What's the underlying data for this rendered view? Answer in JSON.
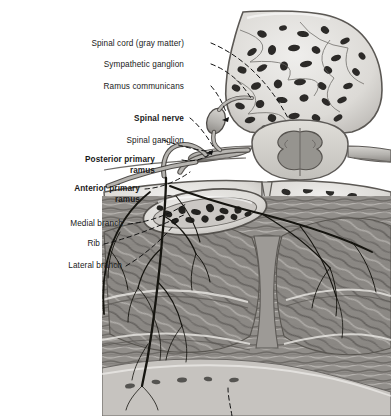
{
  "figure": {
    "background_color": "#ffffff",
    "text_color": "#1a1a1a",
    "leader_line_style": "dashed",
    "width": 391,
    "height": 416
  },
  "labels": [
    {
      "id": "spinal-cord-gray-matter",
      "text": "Spinal cord (gray matter)",
      "bold": false,
      "right": 184,
      "top": 39,
      "lines": 1
    },
    {
      "id": "sympathetic-ganglion",
      "text": "Sympathetic ganglion",
      "bold": false,
      "right": 184,
      "top": 60,
      "lines": 1
    },
    {
      "id": "ramus-communicans",
      "text": "Ramus communicans",
      "bold": false,
      "right": 184,
      "top": 82,
      "lines": 1
    },
    {
      "id": "spinal-nerve",
      "text": "Spinal nerve",
      "bold": true,
      "right": 184,
      "top": 114,
      "lines": 1
    },
    {
      "id": "spinal-ganglion",
      "text": "Spinal ganglion",
      "bold": false,
      "right": 184,
      "top": 136,
      "lines": 1
    },
    {
      "id": "posterior-primary-ramus",
      "text": "Posterior primary\nramus",
      "bold": true,
      "right": 155,
      "top": 155,
      "lines": 2
    },
    {
      "id": "anterior-primary-ramus",
      "text": "Anterior primary\nramus",
      "bold": true,
      "right": 140,
      "top": 184,
      "lines": 2
    },
    {
      "id": "medial-branch",
      "text": "Medial branch",
      "bold": false,
      "right": 123,
      "top": 219,
      "lines": 1
    },
    {
      "id": "rib",
      "text": "Rib",
      "bold": false,
      "right": 100,
      "top": 239,
      "lines": 1
    },
    {
      "id": "lateral-branch",
      "text": "Lateral branch",
      "bold": false,
      "right": 122,
      "top": 261,
      "lines": 1
    }
  ],
  "structures": [
    {
      "id": "vertebral-body",
      "name": "Vertebral body with trabecular bone"
    },
    {
      "id": "spinal-cord",
      "name": "Spinal cord with butterfly gray matter"
    },
    {
      "id": "rib-cross-section",
      "name": "Rib in cross-section with marrow cavity"
    },
    {
      "id": "intercostal-muscle",
      "name": "Intercostal muscle layers"
    },
    {
      "id": "nerve-branches",
      "name": "Branching intercostal nerve fibers"
    }
  ],
  "colors": {
    "bone_fill": "#d8d6d2",
    "bone_outline": "#5a5754",
    "marrow_dark": "#2b2a28",
    "cord_fill": "#cfcdc9",
    "gray_matter": "#9a9894",
    "nerve_fill": "#b9b7b3",
    "nerve_line": "#151515",
    "muscle_mid": "#8e8b87",
    "muscle_dark": "#5d5a57",
    "muscle_light": "#bdbab6",
    "leader": "#111111"
  }
}
